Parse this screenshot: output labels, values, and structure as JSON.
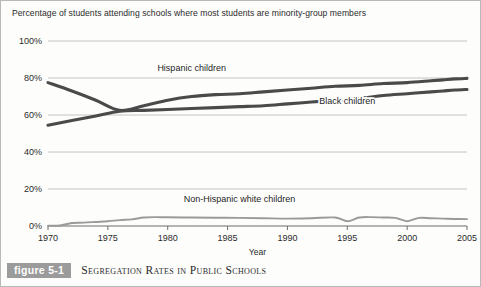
{
  "figure": {
    "number_label": "figure 5-1",
    "caption": "Segregation Rates in Public Schools",
    "number_box_color": "#9b9b9b"
  },
  "chart_data": {
    "type": "line",
    "title": "Percentage of students attending schools where most students are minority-group members",
    "xlabel": "Year",
    "ylabel": "",
    "xlim": [
      1970,
      2005
    ],
    "ylim": [
      0,
      100
    ],
    "grid": true,
    "legend_position": "inline-annotations",
    "x_tick_labels": [
      "1970",
      "1975",
      "1980",
      "1985",
      "1990",
      "1995",
      "2000",
      "2005"
    ],
    "x_ticks": [
      1970,
      1975,
      1980,
      1985,
      1990,
      1995,
      2000,
      2005
    ],
    "y_tick_labels": [
      "0%",
      "20%",
      "40%",
      "60%",
      "80%",
      "100%"
    ],
    "y_ticks": [
      0,
      20,
      40,
      60,
      80,
      100
    ],
    "series": [
      {
        "name": "Hispanic children",
        "color": "#4a4a4a",
        "label_x": 1982,
        "label_y": 84,
        "x": [
          1970,
          1972,
          1974,
          1976,
          1978,
          1980,
          1982,
          1984,
          1986,
          1988,
          1990,
          1992,
          1994,
          1996,
          1998,
          2000,
          2002,
          2003,
          2004,
          2005
        ],
        "values": [
          77.5,
          73.0,
          68.0,
          62.5,
          65.0,
          68.0,
          70.0,
          71.0,
          71.5,
          72.5,
          73.5,
          74.5,
          75.5,
          76.0,
          77.0,
          77.5,
          78.5,
          79.0,
          79.5,
          79.8
        ]
      },
      {
        "name": "Black children",
        "color": "#4a4a4a",
        "label_x": 1995,
        "label_y": 66,
        "x": [
          1970,
          1972,
          1974,
          1976,
          1978,
          1980,
          1982,
          1984,
          1986,
          1988,
          1990,
          1992,
          1994,
          1996,
          1998,
          2000,
          2002,
          2003,
          2004,
          2005
        ],
        "values": [
          54.5,
          57.0,
          59.5,
          62.0,
          62.5,
          63.0,
          63.5,
          64.0,
          64.5,
          65.0,
          66.0,
          67.0,
          68.0,
          69.0,
          70.5,
          71.5,
          72.5,
          73.0,
          73.5,
          73.8
        ]
      },
      {
        "name": "Non-Hispanic white children",
        "color": "#9a9a9a",
        "label_x": 1986,
        "label_y": 13,
        "x": [
          1970,
          1971,
          1972,
          1973,
          1974,
          1975,
          1976,
          1977,
          1978,
          1979,
          1980,
          1982,
          1984,
          1986,
          1988,
          1990,
          1992,
          1994,
          1995,
          1996,
          1997,
          1998,
          1999,
          2000,
          2001,
          2002,
          2003,
          2004,
          2005
        ],
        "values": [
          0.2,
          0.3,
          1.6,
          1.8,
          2.2,
          2.6,
          3.2,
          3.6,
          4.6,
          4.8,
          4.7,
          4.6,
          4.5,
          4.4,
          4.2,
          4.0,
          4.2,
          4.6,
          2.6,
          4.6,
          4.8,
          4.6,
          4.4,
          2.6,
          4.4,
          4.2,
          4.0,
          3.8,
          3.7
        ]
      }
    ]
  }
}
